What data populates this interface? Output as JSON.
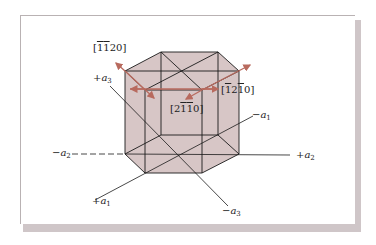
{
  "figure": {
    "type": "hexagonal-crystal-diagram",
    "colors": {
      "crystal_fill": "#d7c6c6",
      "edge": "#1a1a1a",
      "arrow": "#b86a5e",
      "card_shadow": "#cfc6c8"
    },
    "axes": [
      {
        "id": "plus_a1",
        "sign": "+",
        "symbol": "a",
        "index": "1"
      },
      {
        "id": "minus_a1",
        "sign": "−",
        "symbol": "a",
        "index": "1"
      },
      {
        "id": "plus_a2",
        "sign": "+",
        "symbol": "a",
        "index": "2"
      },
      {
        "id": "minus_a2",
        "sign": "−",
        "symbol": "a",
        "index": "2"
      },
      {
        "id": "plus_a3",
        "sign": "+",
        "symbol": "a",
        "index": "3"
      },
      {
        "id": "minus_a3",
        "sign": "−",
        "symbol": "a",
        "index": "3"
      }
    ],
    "directions": [
      {
        "id": "d_11bar20",
        "label": "[ĪĪ20]",
        "parts": [
          {
            "t": "1",
            "bar": true
          },
          {
            "t": "1",
            "bar": true
          },
          {
            "t": "2",
            "bar": false
          },
          {
            "t": "0",
            "bar": false
          }
        ]
      },
      {
        "id": "d_1bar21bar0",
        "label": "[Ī2Ī0]",
        "parts": [
          {
            "t": "1",
            "bar": true
          },
          {
            "t": "2",
            "bar": false
          },
          {
            "t": "1",
            "bar": true
          },
          {
            "t": "0",
            "bar": false
          }
        ]
      },
      {
        "id": "d_21bar1bar0",
        "label": "[2ĪĪ0]",
        "parts": [
          {
            "t": "2",
            "bar": false
          },
          {
            "t": "1",
            "bar": true
          },
          {
            "t": "1",
            "bar": true
          },
          {
            "t": "0",
            "bar": false
          }
        ]
      }
    ]
  }
}
